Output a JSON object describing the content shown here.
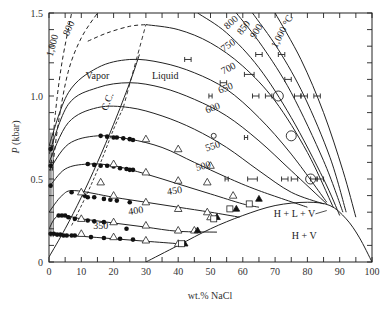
{
  "chart_data": {
    "type": "line",
    "title": "",
    "xlabel": "wt.% NaCl",
    "ylabel": "P (kbar)",
    "xlim": [
      0,
      100
    ],
    "ylim": [
      0,
      1.5
    ],
    "x_ticks": [
      0,
      10,
      20,
      30,
      40,
      50,
      60,
      70,
      80,
      90,
      100
    ],
    "x_tick_labels": [
      "0",
      "10",
      "20",
      "30",
      "40",
      "50",
      "60",
      "70",
      "80",
      "90",
      "100"
    ],
    "y_ticks": [
      0,
      0.5,
      1.0,
      1.5
    ],
    "y_tick_labels": [
      "0",
      "0.5",
      "1.0",
      "1.5"
    ],
    "grid": false,
    "isotherms": [
      {
        "name": "350",
        "label": "350",
        "points": [
          [
            0,
            0.17
          ],
          [
            3,
            0.165
          ],
          [
            10,
            0.155
          ],
          [
            20,
            0.14
          ],
          [
            30,
            0.125
          ],
          [
            40,
            0.11
          ],
          [
            41,
            0.105
          ]
        ]
      },
      {
        "name": "400",
        "label": "400",
        "points": [
          [
            0,
            0.2
          ],
          [
            3,
            0.28
          ],
          [
            10,
            0.26
          ],
          [
            20,
            0.235
          ],
          [
            30,
            0.21
          ],
          [
            40,
            0.185
          ],
          [
            52,
            0.18
          ]
        ]
      },
      {
        "name": "450",
        "label": "450",
        "points": [
          [
            0,
            0.3
          ],
          [
            4,
            0.4
          ],
          [
            8,
            0.43
          ],
          [
            20,
            0.39
          ],
          [
            30,
            0.36
          ],
          [
            40,
            0.33
          ],
          [
            50,
            0.3
          ],
          [
            59,
            0.27
          ]
        ]
      },
      {
        "name": "500",
        "label": "500",
        "points": [
          [
            0,
            0.45
          ],
          [
            5,
            0.56
          ],
          [
            12,
            0.59
          ],
          [
            20,
            0.58
          ],
          [
            30,
            0.53
          ],
          [
            40,
            0.47
          ],
          [
            50,
            0.41
          ],
          [
            60,
            0.35
          ],
          [
            65,
            0.33
          ]
        ]
      },
      {
        "name": "550",
        "label": "550",
        "points": [
          [
            0,
            0.55
          ],
          [
            6,
            0.71
          ],
          [
            15,
            0.76
          ],
          [
            25,
            0.74
          ],
          [
            35,
            0.69
          ],
          [
            45,
            0.6
          ],
          [
            55,
            0.51
          ],
          [
            65,
            0.43
          ],
          [
            80,
            0.33
          ]
        ]
      },
      {
        "name": "600",
        "label": "600",
        "points": [
          [
            0,
            0.6
          ],
          [
            6,
            0.84
          ],
          [
            15,
            0.93
          ],
          [
            25,
            0.93
          ],
          [
            35,
            0.88
          ],
          [
            45,
            0.8
          ],
          [
            55,
            0.69
          ],
          [
            65,
            0.55
          ],
          [
            75,
            0.42
          ],
          [
            85,
            0.35
          ]
        ]
      },
      {
        "name": "650",
        "label": "650",
        "points": [
          [
            0,
            0.65
          ],
          [
            6,
            0.95
          ],
          [
            15,
            1.05
          ],
          [
            25,
            1.08
          ],
          [
            35,
            1.05
          ],
          [
            45,
            0.98
          ],
          [
            55,
            0.88
          ],
          [
            65,
            0.73
          ],
          [
            75,
            0.55
          ],
          [
            86,
            0.35
          ]
        ]
      },
      {
        "name": "700",
        "label": "700",
        "points": [
          [
            0,
            0.7
          ],
          [
            6,
            1.02
          ],
          [
            15,
            1.17
          ],
          [
            25,
            1.22
          ],
          [
            35,
            1.2
          ],
          [
            45,
            1.14
          ],
          [
            55,
            1.04
          ],
          [
            65,
            0.87
          ],
          [
            75,
            0.65
          ],
          [
            86,
            0.36
          ]
        ]
      },
      {
        "name": "750",
        "label": "750",
        "points": [
          [
            30,
            1.43
          ],
          [
            40,
            1.4
          ],
          [
            50,
            1.32
          ],
          [
            60,
            1.18
          ],
          [
            70,
            0.97
          ],
          [
            80,
            0.66
          ],
          [
            88,
            0.33
          ]
        ]
      },
      {
        "name": "800",
        "label": "800",
        "points": [
          [
            46,
            1.5
          ],
          [
            55,
            1.38
          ],
          [
            65,
            1.17
          ],
          [
            75,
            0.87
          ],
          [
            85,
            0.5
          ],
          [
            90,
            0.28
          ]
        ]
      },
      {
        "name": "850",
        "label": "850",
        "points": [
          [
            58,
            1.5
          ],
          [
            66,
            1.3
          ],
          [
            75,
            1.02
          ],
          [
            85,
            0.61
          ],
          [
            91,
            0.3
          ]
        ]
      },
      {
        "name": "900",
        "label": "900",
        "points": [
          [
            63,
            1.5
          ],
          [
            71,
            1.28
          ],
          [
            79,
            1.0
          ],
          [
            87,
            0.63
          ],
          [
            92,
            0.3
          ]
        ]
      },
      {
        "name": "1000",
        "label": "1,000 °C",
        "points": [
          [
            70,
            1.5
          ],
          [
            78,
            1.22
          ],
          [
            85,
            0.9
          ],
          [
            91,
            0.55
          ],
          [
            95,
            0.27
          ]
        ]
      }
    ],
    "metastable_dashed": [
      {
        "name": "800-dashed",
        "label": "800",
        "points": [
          [
            1,
            0.55
          ],
          [
            3,
            0.85
          ],
          [
            6,
            1.15
          ],
          [
            10,
            1.35
          ],
          [
            15,
            1.5
          ]
        ]
      },
      {
        "name": "1000-dashed",
        "label": "1,000",
        "points": [
          [
            0.5,
            0.55
          ],
          [
            2,
            0.9
          ],
          [
            4,
            1.2
          ],
          [
            7,
            1.5
          ]
        ]
      },
      {
        "name": "750-dashed",
        "points": [
          [
            12,
            1.33
          ],
          [
            18,
            1.38
          ],
          [
            25,
            1.42
          ],
          [
            30,
            1.43
          ]
        ]
      }
    ],
    "critical_curve": {
      "label": "C.C.",
      "points": [
        [
          0,
          0.03
        ],
        [
          5,
          0.2
        ],
        [
          10,
          0.39
        ],
        [
          15,
          0.6
        ],
        [
          20,
          0.83
        ],
        [
          25,
          1.08
        ],
        [
          28,
          1.25
        ]
      ]
    },
    "critical_curve_dashed": {
      "points": [
        [
          7,
          0.22
        ],
        [
          12,
          0.42
        ],
        [
          16,
          0.6
        ],
        [
          20,
          0.8
        ],
        [
          23,
          0.93
        ]
      ]
    },
    "critical_curve_upper_dashed": {
      "points": [
        [
          23,
          0.93
        ],
        [
          30,
          1.43
        ]
      ]
    },
    "halite_saturation": {
      "label": "H + L + V",
      "points": [
        [
          30,
          0
        ],
        [
          40,
          0.1
        ],
        [
          50,
          0.2
        ],
        [
          60,
          0.28
        ],
        [
          70,
          0.34
        ],
        [
          80,
          0.36
        ],
        [
          87,
          0.34
        ],
        [
          92,
          0.26
        ],
        [
          96,
          0.15
        ],
        [
          100,
          0
        ]
      ]
    },
    "regions": [
      {
        "label": "Vapor",
        "x": 15,
        "y": 1.1
      },
      {
        "label": "Liquid",
        "x": 36,
        "y": 1.1
      },
      {
        "label": "H + L + V",
        "x": 76,
        "y": 0.27
      },
      {
        "label": "H + V",
        "x": 79,
        "y": 0.14
      }
    ],
    "filled_circles": [
      [
        0.5,
        0.17
      ],
      [
        1.5,
        0.17
      ],
      [
        2.5,
        0.165
      ],
      [
        3.5,
        0.165
      ],
      [
        4.5,
        0.16
      ],
      [
        5.5,
        0.16
      ],
      [
        7,
        0.16
      ],
      [
        8,
        0.16
      ],
      [
        13,
        0.15
      ],
      [
        17,
        0.145
      ],
      [
        22,
        0.14
      ],
      [
        26,
        0.135
      ],
      [
        3,
        0.28
      ],
      [
        4,
        0.28
      ],
      [
        5,
        0.28
      ],
      [
        6,
        0.27
      ],
      [
        8,
        0.26
      ],
      [
        12,
        0.25
      ],
      [
        14,
        0.245
      ],
      [
        17,
        0.24
      ],
      [
        24,
        0.2
      ],
      [
        7,
        0.42
      ],
      [
        11,
        0.4
      ],
      [
        12,
        0.39
      ],
      [
        14,
        0.39
      ],
      [
        17,
        0.38
      ],
      [
        19,
        0.375
      ],
      [
        21,
        0.37
      ],
      [
        25,
        0.36
      ],
      [
        12,
        0.59
      ],
      [
        14,
        0.585
      ],
      [
        16,
        0.58
      ],
      [
        18,
        0.58
      ],
      [
        20,
        0.575
      ],
      [
        22,
        0.565
      ],
      [
        24,
        0.56
      ],
      [
        25,
        0.555
      ],
      [
        26,
        0.555
      ],
      [
        16,
        0.76
      ],
      [
        18,
        0.755
      ],
      [
        20,
        0.75
      ],
      [
        21,
        0.75
      ],
      [
        23,
        0.745
      ],
      [
        25,
        0.74
      ],
      [
        26,
        0.735
      ],
      [
        0.5,
        0.68
      ],
      [
        0.5,
        0.58
      ],
      [
        0.5,
        0.46
      ]
    ],
    "open_triangles": [
      [
        10,
        0.17
      ],
      [
        20,
        0.15
      ],
      [
        30,
        0.13
      ],
      [
        40,
        0.11
      ],
      [
        10,
        0.26
      ],
      [
        20,
        0.24
      ],
      [
        30,
        0.22
      ],
      [
        40,
        0.19
      ],
      [
        45,
        0.19
      ],
      [
        10,
        0.42
      ],
      [
        20,
        0.4
      ],
      [
        30,
        0.36
      ],
      [
        40,
        0.32
      ],
      [
        49,
        0.3
      ],
      [
        50,
        0.27
      ],
      [
        20,
        0.59
      ],
      [
        30,
        0.54
      ],
      [
        40,
        0.49
      ],
      [
        49,
        0.48
      ],
      [
        57,
        0.4
      ],
      [
        30,
        0.74
      ],
      [
        40,
        0.68
      ],
      [
        50,
        0.58
      ],
      [
        16,
        0.48
      ]
    ],
    "filled_triangles": [
      [
        42,
        0.11
      ],
      [
        46,
        0.19
      ],
      [
        52,
        0.27
      ],
      [
        58,
        0.32
      ],
      [
        65,
        0.38
      ]
    ],
    "open_squares": [
      [
        41,
        0.11
      ],
      [
        51,
        0.26
      ],
      [
        56,
        0.32
      ],
      [
        62,
        0.35
      ]
    ],
    "open_circles": [
      [
        51,
        0.76
      ],
      [
        71,
        1.0
      ],
      [
        75,
        0.76
      ],
      [
        81,
        0.5
      ]
    ],
    "error_bars": [
      {
        "x": 54,
        "y": 1.08,
        "dx": 1
      },
      {
        "x": 62,
        "y": 1.13,
        "dx": 1.5
      },
      {
        "x": 65,
        "y": 1.25,
        "dx": 1
      },
      {
        "x": 72,
        "y": 1.25,
        "dx": 1
      },
      {
        "x": 43,
        "y": 1.22,
        "dx": 1
      },
      {
        "x": 50,
        "y": 1.0,
        "dx": 0.5
      },
      {
        "x": 64,
        "y": 1.0,
        "dx": 1
      },
      {
        "x": 74,
        "y": 1.1,
        "dx": 1
      },
      {
        "x": 68,
        "y": 1.0,
        "dx": 1
      },
      {
        "x": 77,
        "y": 1.0,
        "dx": 1
      },
      {
        "x": 79,
        "y": 1.0,
        "dx": 1
      },
      {
        "x": 83,
        "y": 1.0,
        "dx": 1
      },
      {
        "x": 61,
        "y": 0.75,
        "dx": 0.5
      },
      {
        "x": 55,
        "y": 0.5,
        "dx": 0.5
      },
      {
        "x": 63,
        "y": 0.5,
        "dx": 1.5
      },
      {
        "x": 73,
        "y": 0.5,
        "dx": 1
      },
      {
        "x": 76,
        "y": 0.5,
        "dx": 1
      },
      {
        "x": 82,
        "y": 0.5,
        "dx": 1
      },
      {
        "x": 84,
        "y": 0.5,
        "dx": 1
      }
    ]
  }
}
